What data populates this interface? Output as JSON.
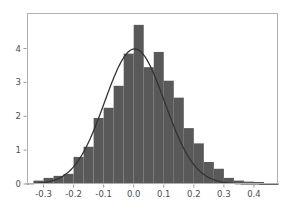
{
  "chart_data": {
    "type": "bar",
    "title": "",
    "subtitle": "",
    "xlabel": "",
    "ylabel": "",
    "xlim": [
      -0.355,
      0.48
    ],
    "ylim": [
      0,
      5.05
    ],
    "grid": false,
    "legend": null,
    "colors": {
      "bar_fill": "#595959",
      "curve_stroke": "#333333",
      "frame": "#b0b0b0",
      "axis": "#9a9a9a",
      "tick_text": "#4d4d4d",
      "background": "#ffffff"
    },
    "xticks": [
      -0.3,
      -0.2,
      -0.1,
      0.0,
      0.1,
      0.2,
      0.3,
      0.4
    ],
    "xtick_labels": [
      "-0.3",
      "-0.2",
      "-0.1",
      "0.0",
      "0.1",
      "0.2",
      "0.3",
      "0.4"
    ],
    "yticks": [
      0,
      1,
      2,
      3,
      4
    ],
    "ytick_labels": [
      "0",
      "1",
      "2",
      "3",
      "4"
    ],
    "bin_width": 0.0333,
    "bin_left_edges": [
      -0.3333,
      -0.3,
      -0.2667,
      -0.2333,
      -0.2,
      -0.1667,
      -0.1333,
      -0.1,
      -0.0667,
      -0.0333,
      0.0,
      0.0333,
      0.0667,
      0.1,
      0.1333,
      0.1667,
      0.2,
      0.2333,
      0.2667,
      0.3,
      0.3333,
      0.3667,
      0.4
    ],
    "bin_centers": [
      -0.3167,
      -0.2833,
      -0.25,
      -0.2167,
      -0.1833,
      -0.15,
      -0.1167,
      -0.0833,
      -0.05,
      -0.0167,
      0.0167,
      0.05,
      0.0833,
      0.1167,
      0.15,
      0.1833,
      0.2167,
      0.25,
      0.2833,
      0.3167,
      0.35,
      0.3833,
      0.4167
    ],
    "categories": [
      "-0.317",
      "-0.283",
      "-0.250",
      "-0.217",
      "-0.183",
      "-0.150",
      "-0.117",
      "-0.083",
      "-0.050",
      "-0.017",
      "0.017",
      "0.050",
      "0.083",
      "0.117",
      "0.150",
      "0.183",
      "0.217",
      "0.250",
      "0.283",
      "0.317",
      "0.350",
      "0.383",
      "0.417"
    ],
    "values": [
      0.1,
      0.18,
      0.24,
      0.3,
      0.8,
      1.1,
      1.95,
      2.25,
      2.9,
      3.85,
      4.7,
      3.45,
      3.9,
      3.05,
      2.55,
      1.65,
      1.2,
      0.65,
      0.45,
      0.18,
      0.1,
      0.07,
      0.06
    ],
    "series": [
      {
        "name": "histogram-density",
        "type": "bar",
        "values": [
          0.1,
          0.18,
          0.24,
          0.3,
          0.8,
          1.1,
          1.95,
          2.25,
          2.9,
          3.85,
          4.7,
          3.45,
          3.9,
          3.05,
          2.55,
          1.65,
          1.2,
          0.65,
          0.45,
          0.18,
          0.1,
          0.07,
          0.06
        ]
      },
      {
        "name": "normal-density-fit",
        "type": "line",
        "mean": 0.003,
        "sigma": 0.1,
        "peak": 3.99
      }
    ]
  },
  "figure": {
    "background": "#ffffff",
    "plot_area": {
      "left": 27,
      "top": 13,
      "right": 278,
      "bottom": 184
    }
  }
}
